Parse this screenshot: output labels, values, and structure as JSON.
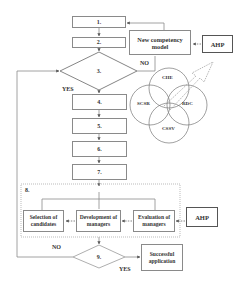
{
  "diagram": {
    "steps": [
      "1.",
      "2.",
      "3.",
      "4.",
      "5.",
      "6.",
      "7.",
      "8.",
      "9."
    ],
    "new_competency_model": "New competency model",
    "ahp_top": "AHP",
    "ahp_bottom": "AHP",
    "decision3": {
      "no": "NO",
      "yes": "YES"
    },
    "decision9": {
      "no": "NO",
      "yes": "YES"
    },
    "venn": [
      "CHE",
      "SCSR",
      "RDC",
      "CSSV"
    ],
    "stage8_boxes": [
      "Selection of candidates",
      "Development of managers",
      "Evaluation of managers"
    ],
    "successful_application": "Successful application"
  }
}
